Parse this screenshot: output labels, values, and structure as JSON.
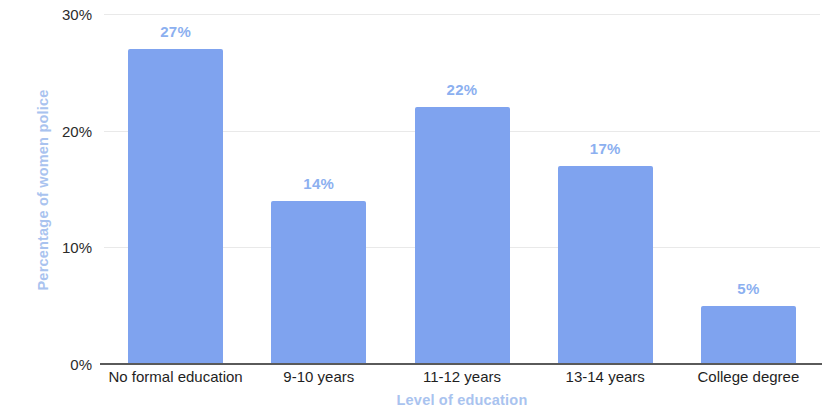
{
  "chart_data": {
    "type": "bar",
    "title": "",
    "categories": [
      "No formal education",
      "9-10 years",
      "11-12 years",
      "13-14 years",
      "College degree"
    ],
    "values": [
      27,
      14,
      22,
      17,
      5
    ],
    "value_labels": [
      "27%",
      "14%",
      "22%",
      "17%",
      "5%"
    ],
    "xlabel": "Level of education",
    "ylabel": "Percentage of women police",
    "ylim": [
      0,
      30
    ],
    "yticks": [
      0,
      10,
      20,
      30
    ],
    "ytick_labels": [
      "0%",
      "10%",
      "20%",
      "30%"
    ],
    "grid": true,
    "legend": null,
    "colors": {
      "bar": "#7fa3ef",
      "value_label": "#8cb0f0",
      "axis_title": "#a9c3ef",
      "tick_label": "#222222",
      "gridline": "#e9e9e9",
      "baseline": "#5a5a5a",
      "background": "#ffffff"
    }
  }
}
